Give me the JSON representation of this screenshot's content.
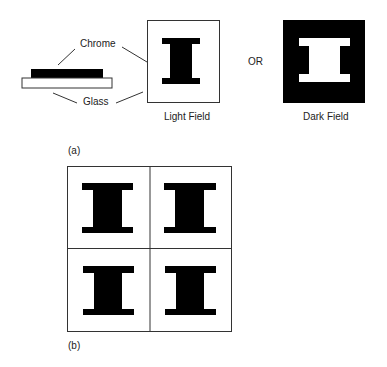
{
  "labels": {
    "chrome": "Chrome",
    "glass": "Glass",
    "light_field": "Light Field",
    "or": "OR",
    "dark_field": "Dark Field",
    "part_a": "(a)",
    "part_b": "(b)"
  },
  "colors": {
    "chrome": "#000000",
    "glass": "#ffffff",
    "outline": "#333333"
  },
  "grid": {
    "rows": 2,
    "cols": 2,
    "cell_shape": "I-beam",
    "field": "light"
  }
}
